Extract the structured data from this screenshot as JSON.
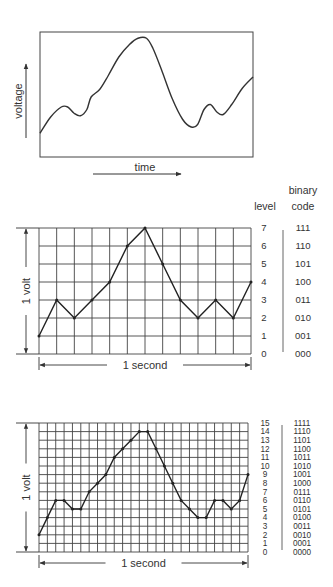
{
  "panel_analog": {
    "y_label": "voltage",
    "x_label": "time",
    "box": {
      "x": 40,
      "y": 32,
      "w": 213,
      "h": 125
    },
    "curve_points": [
      [
        0,
        0.81
      ],
      [
        0.05,
        0.68
      ],
      [
        0.1,
        0.6
      ],
      [
        0.13,
        0.6
      ],
      [
        0.16,
        0.65
      ],
      [
        0.19,
        0.67
      ],
      [
        0.22,
        0.62
      ],
      [
        0.24,
        0.52
      ],
      [
        0.28,
        0.46
      ],
      [
        0.32,
        0.35
      ],
      [
        0.37,
        0.2
      ],
      [
        0.42,
        0.1
      ],
      [
        0.46,
        0.05
      ],
      [
        0.5,
        0.05
      ],
      [
        0.53,
        0.13
      ],
      [
        0.57,
        0.3
      ],
      [
        0.62,
        0.53
      ],
      [
        0.67,
        0.7
      ],
      [
        0.71,
        0.76
      ],
      [
        0.74,
        0.74
      ],
      [
        0.77,
        0.62
      ],
      [
        0.8,
        0.58
      ],
      [
        0.83,
        0.64
      ],
      [
        0.86,
        0.66
      ],
      [
        0.9,
        0.58
      ],
      [
        0.95,
        0.45
      ],
      [
        1,
        0.36
      ]
    ]
  },
  "panel_3bit": {
    "header_level": "level",
    "header_binary": "binary\ncode",
    "header_binary_line1": "binary",
    "header_binary_line2": "code",
    "y_span_label": "1 volt",
    "x_span_label": "1 second",
    "grid": {
      "x": 39,
      "y": 228,
      "w": 212,
      "h": 126,
      "cols": 12,
      "rows": 7
    },
    "levels": [
      "0",
      "1",
      "2",
      "3",
      "4",
      "5",
      "6",
      "7"
    ],
    "codes": [
      "000",
      "001",
      "010",
      "011",
      "100",
      "101",
      "110",
      "111"
    ],
    "samples": [
      1,
      3,
      2,
      3,
      4,
      6,
      7,
      5,
      3,
      2,
      3,
      2,
      4
    ]
  },
  "panel_4bit": {
    "y_span_label": "1 volt",
    "x_span_label": "1 second",
    "grid": {
      "x": 39,
      "y": 423,
      "w": 209,
      "h": 129,
      "cols": 25,
      "rows": 15
    },
    "levels": [
      "0",
      "1",
      "2",
      "3",
      "4",
      "5",
      "6",
      "7",
      "8",
      "9",
      "10",
      "11",
      "12",
      "13",
      "14",
      "15"
    ],
    "codes": [
      "0000",
      "0001",
      "0010",
      "0011",
      "0100",
      "0101",
      "0110",
      "0111",
      "1000",
      "1001",
      "1010",
      "1011",
      "1100",
      "1101",
      "1110",
      "1111"
    ],
    "samples": [
      2,
      4,
      6,
      6,
      5,
      5,
      7,
      8,
      9,
      11,
      12,
      13,
      14,
      14,
      12,
      10,
      8,
      6,
      5,
      4,
      4,
      6,
      6,
      5,
      6,
      9
    ]
  }
}
